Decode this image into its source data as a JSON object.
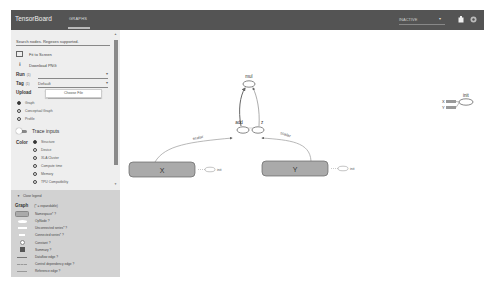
{
  "header": {
    "brand": "TensorBoard",
    "tabs": [
      {
        "label": "GRAPHS",
        "active": true
      }
    ],
    "run_status": "INACTIVE",
    "icons": [
      "reload-icon",
      "settings-icon"
    ]
  },
  "sidebar": {
    "search_placeholder": "Search nodes. Regexes supported.",
    "fit_to_screen": "Fit to Screen",
    "download_png": "Download PNG",
    "run": {
      "label": "Run",
      "count": "(1)",
      "value": ""
    },
    "tag": {
      "label": "Tag",
      "count": "(1)",
      "value": "Default"
    },
    "upload": {
      "label": "Upload",
      "button": "Choose File"
    },
    "graph_type": {
      "options": [
        "Graph",
        "Conceptual Graph",
        "Profile"
      ],
      "selected": "Graph"
    },
    "trace_inputs": "Trace inputs",
    "color": {
      "label": "Color",
      "options": [
        "Structure",
        "Device",
        "XLA Cluster",
        "Compute time",
        "Memory",
        "TPU Compatibility"
      ],
      "selected": "Structure"
    }
  },
  "legend": {
    "toggle": "Close legend",
    "title": "Graph",
    "subtitle": "(* = expandable)",
    "items": [
      {
        "symbol": "namespace",
        "label": "Namespace* ?"
      },
      {
        "symbol": "op",
        "label": "OpNode ?"
      },
      {
        "symbol": "unconnected",
        "label": "Unconnected series* ?"
      },
      {
        "symbol": "connected",
        "label": "Connected series* ?"
      },
      {
        "symbol": "constant",
        "label": "Constant ?"
      },
      {
        "symbol": "summary",
        "label": "Summary ?"
      },
      {
        "symbol": "dataflow",
        "label": "Dataflow edge ?"
      },
      {
        "symbol": "control",
        "label": "Control dependency edge ?"
      },
      {
        "symbol": "reference",
        "label": "Reference edge ?"
      }
    ]
  },
  "graph": {
    "nodes": [
      {
        "id": "mul",
        "label": "mul",
        "type": "op"
      },
      {
        "id": "add",
        "label": "add",
        "type": "op"
      },
      {
        "id": "z",
        "label": "z",
        "type": "op"
      },
      {
        "id": "X",
        "label": "X",
        "type": "namespace"
      },
      {
        "id": "Y",
        "label": "Y",
        "type": "namespace"
      },
      {
        "id": "X_init",
        "label": "init",
        "type": "op"
      },
      {
        "id": "Y_init",
        "label": "init",
        "type": "op"
      },
      {
        "id": "init",
        "label": "init",
        "type": "op"
      }
    ],
    "edge_labels": {
      "x_to_add": "scalar",
      "y_to_z": "scalar"
    },
    "aux": {
      "init_inputs": [
        "X",
        "Y"
      ]
    }
  }
}
